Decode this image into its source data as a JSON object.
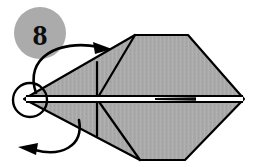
{
  "figure": {
    "kind": "origami-fold-diagram",
    "step_badge": {
      "label": "8",
      "shape": "circle",
      "fill_color": "#ababab",
      "center_x": 40,
      "center_y": 33,
      "radius": 26
    },
    "canvas": {
      "width": 253,
      "height": 167,
      "background_color": "#ffffff"
    },
    "palette": {
      "paper_fill": "#a9a9a9",
      "paper_fill_light": "#b4b4b4",
      "outline_color": "#000000",
      "crease_color": "#000000",
      "arrow_color": "#000000",
      "center_band_color": "#ffffff"
    },
    "model_outline": {
      "name": "folded-paper-silhouette",
      "points": "24,99 135,35 188,35 244,99 185,160 140,160 24,99"
    },
    "creases": [
      {
        "name": "upper-left-diagonal",
        "x1": 24,
        "y1": 99,
        "x2": 135,
        "y2": 35
      },
      {
        "name": "upper-apex-to-center",
        "x1": 135,
        "y1": 35,
        "x2": 97,
        "y2": 99
      },
      {
        "name": "upper-right-diagonal",
        "x1": 188,
        "y1": 35,
        "x2": 244,
        "y2": 99
      },
      {
        "name": "upper-vertical-crease",
        "x1": 97,
        "y1": 62,
        "x2": 97,
        "y2": 99
      },
      {
        "name": "lower-left-diagonal",
        "x1": 24,
        "y1": 99,
        "x2": 140,
        "y2": 160
      },
      {
        "name": "lower-apex-to-center",
        "x1": 140,
        "y1": 160,
        "x2": 97,
        "y2": 99
      },
      {
        "name": "lower-right-diagonal",
        "x1": 185,
        "y1": 160,
        "x2": 244,
        "y2": 99
      },
      {
        "name": "lower-vertical-crease",
        "x1": 97,
        "y1": 99,
        "x2": 97,
        "y2": 136
      }
    ],
    "center_band": {
      "name": "horizontal-open-edge",
      "x1": 24,
      "y1": 99,
      "x2": 244,
      "y2": 99,
      "white_thickness": 5,
      "dark_marker": {
        "x1": 155,
        "x2": 196,
        "y": 99
      }
    },
    "detail_circle": {
      "name": "left-point-highlight",
      "center_x": 30,
      "center_y": 100,
      "radius": 17
    },
    "arrows": [
      {
        "name": "upper-fold-arrow",
        "direction": "up-and-right",
        "path": "M 36,93 C 26,60 58,40 98,47",
        "head_x": 108,
        "head_y": 48,
        "head_angle": 12
      },
      {
        "name": "lower-fold-arrow",
        "direction": "down-and-left",
        "path": "M 78,120 C 82,146 60,156 34,150",
        "head_x": 22,
        "head_y": 148,
        "head_angle": 192
      }
    ]
  }
}
